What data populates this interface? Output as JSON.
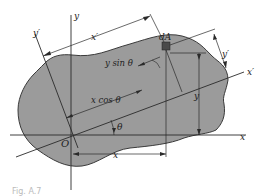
{
  "figure": {
    "caption": "Fig. A.7",
    "colors": {
      "region_fill": "#9b9b9b",
      "region_stroke": "#3a3a3a",
      "line": "#2a2a2a",
      "background": "#ffffff",
      "element_fill": "#4a4a4a"
    }
  },
  "axes": {
    "x_label": "x",
    "y_label": "y",
    "x_prime_label": "x′",
    "y_prime_label": "y′",
    "origin_label": "O"
  },
  "labels": {
    "element": "dA",
    "y_sin_theta": "y sin θ",
    "x_cos_theta": "x cos θ",
    "theta": "θ",
    "x_dim": "x",
    "y_dim": "y",
    "x_prime_dim": "x′",
    "y_prime_dim": "y′"
  }
}
